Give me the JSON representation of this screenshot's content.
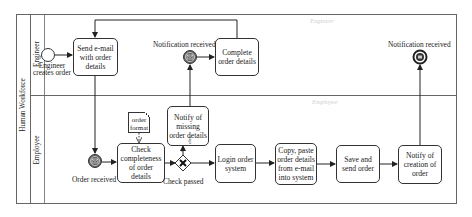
{
  "pool": {
    "label": "Human Workforce",
    "lanes": [
      {
        "id": "engineer",
        "label": "Engineer",
        "watermark": "Engineer"
      },
      {
        "id": "employee",
        "label": "Employee",
        "watermark": "Employee"
      }
    ]
  },
  "events": {
    "start": {
      "label": "Engineer creates order",
      "type": "start"
    },
    "notification_received_1": {
      "label": "Notification received",
      "type": "intermediate-message-catch"
    },
    "notification_received_end": {
      "label": "Notification received",
      "type": "end-message"
    },
    "order_received": {
      "label": "Order received",
      "type": "intermediate-message-catch"
    }
  },
  "tasks": {
    "send_email": {
      "label": "Send e-mail with order details"
    },
    "complete_order": {
      "label": "Complete order details"
    },
    "check_completeness": {
      "label": "Check completeness of order details"
    },
    "notify_missing": {
      "label": "Notify of missing order details"
    },
    "login": {
      "label": "Login order system"
    },
    "copy_paste": {
      "label": "Copy, paste order details from e-mail into system"
    },
    "save_send": {
      "label": "Save and send order"
    },
    "notify_creation": {
      "label": "Notify of creation of order"
    }
  },
  "gateway": {
    "label": "Check passed",
    "type": "exclusive",
    "branch_label": "else"
  },
  "data_object": {
    "label": "order format"
  },
  "colors": {
    "stroke": "#333333",
    "event_fill": "#555555",
    "ghost_text": "#cfcfcf"
  }
}
